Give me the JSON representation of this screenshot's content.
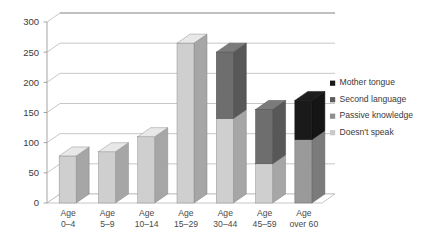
{
  "chart_data": {
    "type": "bar",
    "subtype": "stacked-column-3d",
    "title": "",
    "xlabel": "",
    "ylabel": "",
    "ylim": [
      0,
      300
    ],
    "yticks": [
      0,
      50,
      100,
      150,
      200,
      250,
      300
    ],
    "ytick_labels": [
      "0",
      "50",
      "100",
      "150",
      "200",
      "250",
      "300"
    ],
    "grid": true,
    "legend_position": "right",
    "categories": [
      "Age 0–4",
      "Age 5–9",
      "Age 10–14",
      "Age 15–29",
      "Age 30–44",
      "Age 45–59",
      "Age over 60"
    ],
    "category_lines": [
      [
        "Age",
        "0–4"
      ],
      [
        "Age",
        "5–9"
      ],
      [
        "Age",
        "10–14"
      ],
      [
        "Age",
        "15–29"
      ],
      [
        "Age",
        "30–44"
      ],
      [
        "Age",
        "45–59"
      ],
      [
        "Age",
        "over 60"
      ]
    ],
    "series": [
      {
        "name": "Doesn't speak",
        "color": "#cfcfcf",
        "values": [
          78,
          85,
          110,
          265,
          140,
          65,
          0
        ]
      },
      {
        "name": "Passive knowledge",
        "color": "#9a9a9a",
        "values": [
          0,
          0,
          0,
          0,
          0,
          0,
          105
        ]
      },
      {
        "name": "Second language",
        "color": "#6e6e6e",
        "values": [
          0,
          0,
          0,
          0,
          110,
          90,
          0
        ]
      },
      {
        "name": "Mother tongue",
        "color": "#1a1a1a",
        "values": [
          0,
          0,
          0,
          0,
          0,
          0,
          65
        ]
      }
    ],
    "totals": [
      78,
      85,
      110,
      265,
      250,
      155,
      170
    ]
  },
  "legend": {
    "items": [
      {
        "label": "Mother tongue",
        "color": "#1a1a1a"
      },
      {
        "label": "Second language",
        "color": "#5d5d5d"
      },
      {
        "label": "Passive knowledge",
        "color": "#8f8f8f"
      },
      {
        "label": "Doesn't speak",
        "color": "#c9c9c9"
      }
    ]
  },
  "colors": {
    "grid": "#b9b9b9",
    "axis": "#9a9a9a",
    "floor": "#ffffff",
    "floor_edge": "#b9b9b9",
    "text": "#3a3a3a"
  }
}
